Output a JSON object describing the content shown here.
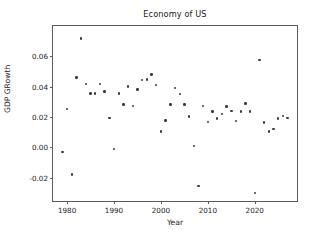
{
  "chart_data": {
    "type": "scatter",
    "title": "Economy of US",
    "xlabel": "Year",
    "ylabel": "GDP GRowth",
    "grid": false,
    "legend": null,
    "xlim": [
      1977.0,
      2029.0
    ],
    "ylim": [
      -0.0355,
      0.08
    ],
    "xticks": [
      1980,
      1990,
      2000,
      2010,
      2020
    ],
    "xtick_labels": [
      "1980",
      "1990",
      "2000",
      "2010",
      "2020"
    ],
    "yticks": [
      0.06,
      0.04,
      0.02,
      0.0,
      -0.02
    ],
    "ytick_labels": [
      "0.06",
      "0.04",
      "0.02",
      "0.00",
      "-0.02"
    ],
    "marker": "point",
    "marker_color": "#3b3b3b",
    "x": [
      1979,
      1980,
      1981,
      1982,
      1983,
      1984,
      1985,
      1986,
      1987,
      1988,
      1989,
      1990,
      1991,
      1992,
      1993,
      1994,
      1995,
      1996,
      1997,
      1998,
      1999,
      2000,
      2001,
      2002,
      2003,
      2004,
      2005,
      2006,
      2007,
      2008,
      2009,
      2010,
      2011,
      2012,
      2013,
      2014,
      2015,
      2016,
      2017,
      2018,
      2019,
      2020,
      2021,
      2022,
      2023,
      2024,
      2025,
      2026,
      2027
    ],
    "y": [
      -0.0033,
      0.0251,
      -0.0179,
      0.0459,
      0.0718,
      0.0419,
      0.0355,
      0.0354,
      0.0419,
      0.0368,
      0.0193,
      -0.001,
      0.0354,
      0.0283,
      0.0401,
      0.0271,
      0.038,
      0.0443,
      0.0448,
      0.048,
      0.041,
      0.0104,
      0.0176,
      0.0283,
      0.039,
      0.0351,
      0.0283,
      0.0204,
      0.0008,
      -0.0257,
      0.0271,
      0.0165,
      0.0235,
      0.019,
      0.0219,
      0.0268,
      0.0239,
      0.0175,
      0.0235,
      0.0289,
      0.0235,
      -0.0304,
      0.0574,
      0.0163,
      0.0104,
      0.0121,
      0.0189,
      0.0207,
      0.0192
    ]
  }
}
